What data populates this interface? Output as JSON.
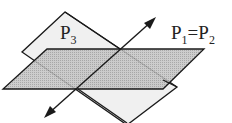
{
  "diagram": {
    "labels": {
      "plane3": "P",
      "plane3_sub": "3",
      "plane12_a": "P",
      "plane12_a_sub": "1",
      "equals": "=",
      "plane12_b": "P",
      "plane12_b_sub": "2"
    },
    "colors": {
      "plane3_fill": "#eeeeee",
      "plane12_fill": "#b8b8b8",
      "stroke": "#1a1a1a"
    }
  }
}
